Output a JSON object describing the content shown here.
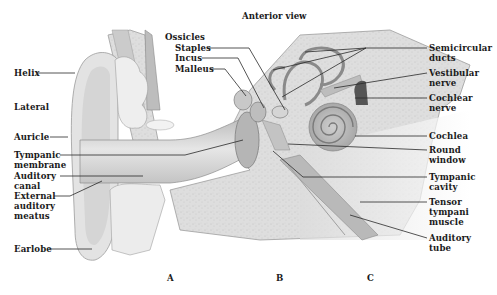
{
  "diagram": {
    "title": "Anterior view",
    "section_markers": [
      "A",
      "B",
      "C"
    ],
    "left_labels": {
      "helix": "Helix",
      "lateral": "Lateral",
      "auricle": "Auricle",
      "tympanic_membrane": [
        "Tympanic",
        "membrane"
      ],
      "auditory_canal": [
        "Auditory",
        "canal"
      ],
      "external_auditory_meatus": [
        "External",
        "auditory",
        "meatus"
      ],
      "earlobe": "Earlobe"
    },
    "top_labels": {
      "ossicles": "Ossicles",
      "staples": "Staples",
      "incus": "Incus",
      "malleus": "Malleus"
    },
    "right_labels": {
      "semicircular_ducts": [
        "Semicircular",
        "ducts"
      ],
      "vestibular_nerve": [
        "Vestibular",
        "nerve"
      ],
      "cochlear_nerve": [
        "Cochlear",
        "nerve"
      ],
      "cochlea": "Cochlea",
      "round_window": [
        "Round",
        "window"
      ],
      "tympanic_cavity": [
        "Tympanic",
        "cavity"
      ],
      "tensor_tympani_muscle": [
        "Tensor",
        "tympani",
        "muscle"
      ],
      "auditory_tube": [
        "Auditory",
        "tube"
      ]
    },
    "colors": {
      "background": "#ffffff",
      "bone": "#d9d9d9",
      "tissue": "#e9e9e9",
      "shadow": "#9a9a9a",
      "leader_line": "#2a2a2a",
      "text": "#1a1a1a"
    }
  }
}
